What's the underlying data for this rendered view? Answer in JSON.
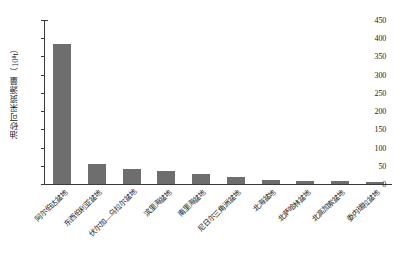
{
  "chart_data": {
    "type": "bar",
    "title": "",
    "xlabel": "",
    "ylabel": "油砂可采资源量（10⁸t）",
    "ylim": [
      0,
      450
    ],
    "ytick_values": [
      0,
      50,
      100,
      150,
      200,
      250,
      300,
      350,
      400,
      450
    ],
    "ytick_labels": [
      "0",
      "50",
      "100",
      "150",
      "200",
      "250",
      "300",
      "350",
      "400",
      "450"
    ],
    "grid": false,
    "legend": null,
    "bar_color": "#6e6e6e",
    "categories": [
      "阿尔伯达盆地",
      "东西伯利亚盆地",
      "伏尔加—乌拉尔盆地",
      "滨里海盆地",
      "南里海盆地",
      "尼日尔三角洲盆地",
      "北海盆地",
      "北萨哈林盆地",
      "北高加索盆地",
      "委内瑞拉盆地"
    ],
    "values": [
      385,
      55,
      42,
      35,
      28,
      18,
      10,
      8,
      7,
      6
    ]
  },
  "axis": {
    "y_title": "油砂可采资源量（10⁸t）"
  }
}
